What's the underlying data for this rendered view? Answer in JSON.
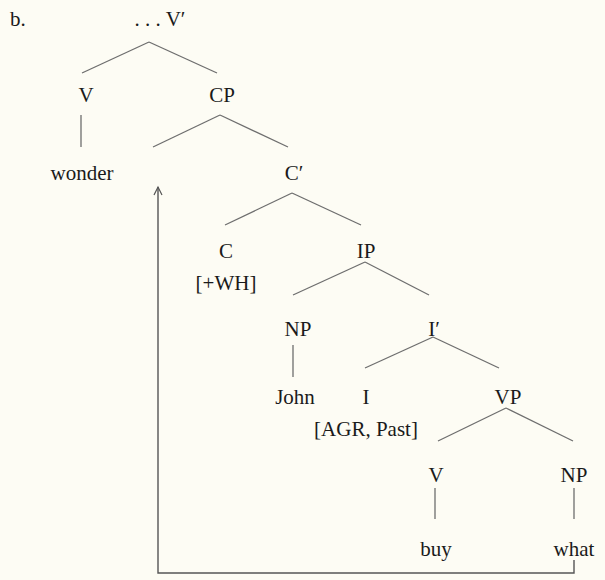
{
  "example_label": "b.",
  "tree": {
    "nodes": [
      {
        "id": "vbar",
        "label": ". . . V′",
        "x": 160,
        "y": 8
      },
      {
        "id": "v",
        "label": "V",
        "x": 86,
        "y": 84
      },
      {
        "id": "cp",
        "label": "CP",
        "x": 222,
        "y": 84
      },
      {
        "id": "wonder",
        "label": "wonder",
        "x": 82,
        "y": 162
      },
      {
        "id": "cbar",
        "label": "C′",
        "x": 294,
        "y": 162
      },
      {
        "id": "c",
        "label": "C",
        "x": 226,
        "y": 240
      },
      {
        "id": "wh",
        "label": "[+WH]",
        "x": 226,
        "y": 272
      },
      {
        "id": "ip",
        "label": "IP",
        "x": 366,
        "y": 240
      },
      {
        "id": "np1",
        "label": "NP",
        "x": 298,
        "y": 318
      },
      {
        "id": "ibar",
        "label": "I′",
        "x": 434,
        "y": 318
      },
      {
        "id": "john",
        "label": "John",
        "x": 295,
        "y": 386
      },
      {
        "id": "i",
        "label": "I",
        "x": 366,
        "y": 386
      },
      {
        "id": "agr",
        "label": "[AGR, Past]",
        "x": 366,
        "y": 418
      },
      {
        "id": "vp",
        "label": "VP",
        "x": 508,
        "y": 386
      },
      {
        "id": "v2",
        "label": "V",
        "x": 436,
        "y": 464
      },
      {
        "id": "np2",
        "label": "NP",
        "x": 574,
        "y": 464
      },
      {
        "id": "buy",
        "label": "buy",
        "x": 436,
        "y": 538
      },
      {
        "id": "what",
        "label": "what",
        "x": 574,
        "y": 538
      }
    ],
    "edges": [
      [
        149,
        42,
        82,
        73
      ],
      [
        149,
        42,
        217,
        73
      ],
      [
        81,
        115,
        81,
        147
      ],
      [
        220,
        115,
        153,
        147
      ],
      [
        220,
        115,
        288,
        147
      ],
      [
        292,
        193,
        225,
        225
      ],
      [
        292,
        193,
        361,
        225
      ],
      [
        365,
        262,
        293,
        295
      ],
      [
        365,
        262,
        429,
        295
      ],
      [
        293,
        345,
        293,
        377
      ],
      [
        433,
        337,
        365,
        368
      ],
      [
        433,
        337,
        499,
        368
      ],
      [
        506,
        408,
        438,
        441
      ],
      [
        506,
        408,
        573,
        441
      ],
      [
        435,
        488,
        435,
        519
      ],
      [
        574,
        488,
        574,
        519
      ]
    ],
    "movement_arrow": {
      "from": "what",
      "to": "spec-CP",
      "points": [
        [
          574,
          560
        ],
        [
          574,
          573
        ],
        [
          158,
          573
        ],
        [
          158,
          187
        ]
      ]
    }
  },
  "colors": {
    "background": "#fdfcf4",
    "text": "#1a1a1a",
    "line": "#6e6e6e"
  }
}
